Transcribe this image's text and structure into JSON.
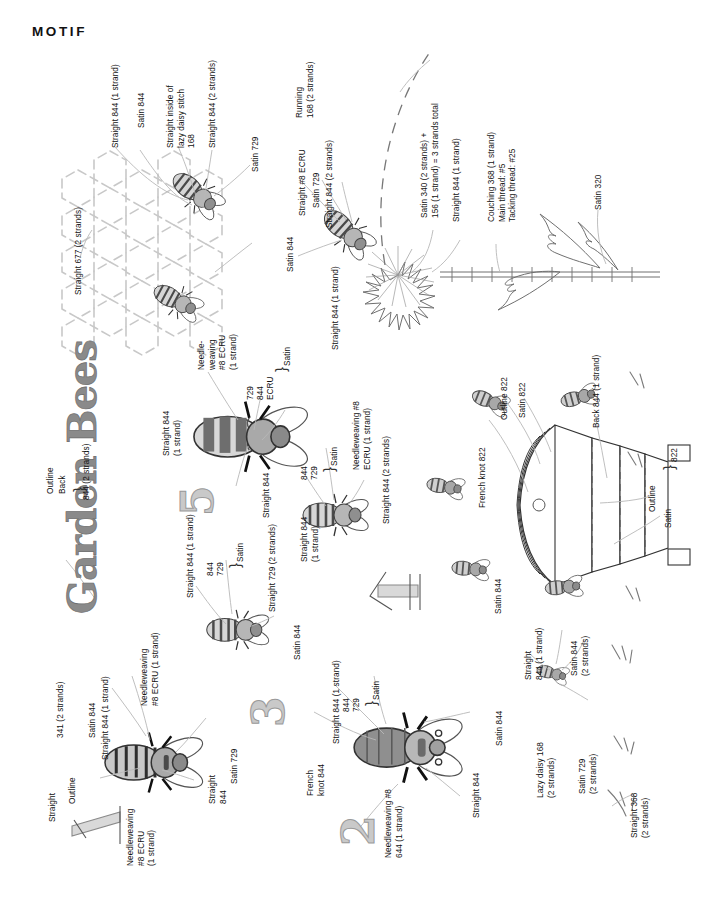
{
  "header": {
    "title": "MOTIF"
  },
  "design": {
    "title": "Garden Bees",
    "title_label_lines": [
      "Outline",
      "Back"
    ],
    "title_thread": "844 (2 strands)"
  },
  "honeycomb": {
    "labels": [
      "Straight 677 (2 strands)",
      "Straight 844 (1 strand)",
      "Satin 844",
      "Straight inside of\nlazy daisy stitch\n168",
      "Straight 844 (2 strands)",
      "Satin 729"
    ]
  },
  "flower_section": {
    "labels": [
      "Running\n168 (2 strands)",
      "Straight #8 ECRU",
      "Satin 729",
      "Straight 844 (2 strands)",
      "Satin 844",
      "Straight 844 (1 strand)",
      "Satin 340 (2 strands) +\n156 (1 strand) = 3 strands total",
      "Straight 844 (1 strand)",
      "Couching 368 (1 strand)\nMain thread: #5\nTacking thread: #25",
      "Satin 320"
    ]
  },
  "bee_large_top": {
    "labels": [
      "Needle-\nweaving\n#8 ECRU\n(1 strand)",
      "Satin",
      "729",
      "844",
      "ECRU",
      "Straight 844\n(1 strand)",
      "Straight 844"
    ]
  },
  "bee_mid_right": {
    "labels": [
      "Needleweaving #8\nECRU (1 strand)",
      "Satin",
      "844",
      "729",
      "Straight 844\n(1 strand)",
      "Straight 844 (2 strands)"
    ]
  },
  "bee_mid_left": {
    "labels": [
      "Needleweaving\n#8 ECRU (1 strand)",
      "Straight 844 (1 strand)",
      "Satin",
      "844",
      "729",
      "Satin 844",
      "Straight 729 (2 strands)"
    ]
  },
  "bee_bottom_left": {
    "labels": [
      "Straight",
      "Outline",
      "341 (2 strands)",
      "Satin 844",
      "Straight 844 (1 strand)",
      "Needleweaving\n#8 ECRU\n(1 strand)",
      "Straight\n844",
      "Satin 729"
    ]
  },
  "bee_bottom_mid": {
    "labels": [
      "French\nknot 844",
      "Straight 844 (1 strand)",
      "Satin",
      "844",
      "729",
      "Satin 844",
      "Straight 844",
      "Needleweaving #8\n644 (1 strand)"
    ]
  },
  "hive": {
    "labels": [
      "French knot 822",
      "Outline 822",
      "Satin 822",
      "Back 844 (1 strand)",
      "Outline",
      "Satin",
      "822"
    ]
  },
  "grass_section": {
    "labels": [
      "Straight\n844 (1 strand)",
      "Satin 844\n(2 strands)",
      "Lazy daisy 168\n(2 strands)",
      "Satin 729\n(2 strands)",
      "Straight 368\n(2 strands)"
    ]
  },
  "numerals": [
    "5",
    "3",
    "4",
    "1",
    "2"
  ],
  "colors": {
    "ink": "#111111",
    "line": "#6f6f6f",
    "honeycomb": "#c8c8c8",
    "bee_body_light": "#d6d6d6",
    "bee_body_dark": "#6e6e6e",
    "bee_head": "#9b9b9b",
    "numeral_fill": "#c9c9c9",
    "title_fill": "#8a8a8a",
    "leader": "#b0b0b0"
  }
}
